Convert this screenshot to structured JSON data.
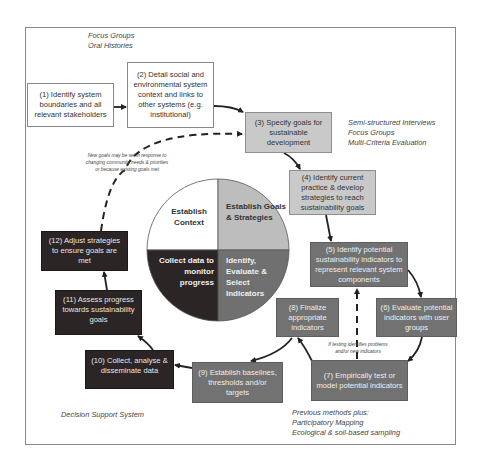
{
  "colors": {
    "white_box": "#ffffff",
    "light_box": "#c9c9c9",
    "mid_box": "#727272",
    "dark_box": "#2b2525",
    "quadrant_context": "#ffffff",
    "quadrant_goals": "#bdbdbd",
    "quadrant_indicators": "#707070",
    "quadrant_collect": "#2b2525"
  },
  "steps": [
    {
      "id": 1,
      "text": "(1) Identify system boundaries and all relevant stakeholders",
      "shade": "white"
    },
    {
      "id": 2,
      "text": "(2) Detail social and environmental system context and links to other systems (e.g. institutional)",
      "shade": "white"
    },
    {
      "id": 3,
      "text": "(3) Specify goals for sustainable development",
      "shade": "light"
    },
    {
      "id": 4,
      "text": "(4) Identify current practice & develop strategies to reach sustainability goals",
      "shade": "light"
    },
    {
      "id": 5,
      "text": "(5) Identify potential sustainability indicators to represent relevant system components",
      "shade": "mid"
    },
    {
      "id": 6,
      "text": "(6) Evaluate potential indicators with user groups",
      "shade": "mid"
    },
    {
      "id": 7,
      "text": "(7) Empirically test or model potential indicators",
      "shade": "mid"
    },
    {
      "id": 8,
      "text": "(8) Finalize appropriate indicators",
      "shade": "mid"
    },
    {
      "id": 9,
      "text": "(9) Establish baselines, thresholds and/or targets",
      "shade": "mid"
    },
    {
      "id": 10,
      "text": "(10) Collect, analyse & disseminate data",
      "shade": "dark"
    },
    {
      "id": 11,
      "text": "(11) Assess progress towards sustainability goals",
      "shade": "dark"
    },
    {
      "id": 12,
      "text": "(12) Adjust strategies to ensure goals are met",
      "shade": "dark"
    }
  ],
  "center_circle": {
    "top_left": "Establish Context",
    "top_right": "Establish Goals & Strategies",
    "bottom_right": "Identify, Evaluate & Select Indicators",
    "bottom_left": "Collect data to monitor progress"
  },
  "methods": {
    "top_left": [
      "Focus Groups",
      "Oral Histories"
    ],
    "right": [
      "Semi-structured Interviews",
      "Focus Groups",
      "Multi-Criteria Evaluation"
    ],
    "bottom_right": [
      "Previous methods plus:",
      "Participatory Mapping",
      "Ecological & soil-based sampling"
    ],
    "bottom_left": [
      "Decision Support System"
    ]
  },
  "annotations": {
    "new_goals": [
      "New goals may be set in response to",
      "changing community needs & priorities",
      "or because existing goals met"
    ],
    "testing": [
      "If testing identifies problems",
      "and/or new indicators"
    ]
  }
}
